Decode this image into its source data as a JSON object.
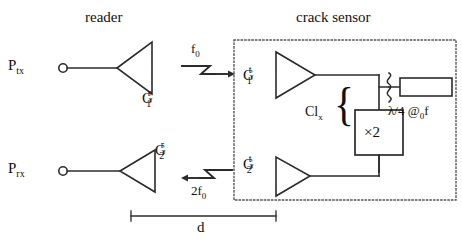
{
  "diagram": {
    "type": "schematic",
    "stroke_color": "#2b2b2b",
    "text_color": "#111111",
    "background": "#ffffff"
  },
  "reader": {
    "title": "reader",
    "tx_port_label_main": "P",
    "tx_port_label_sub": "tx",
    "rx_port_label_main": "P",
    "rx_port_label_sub": "rx",
    "amp_tx": {
      "base": "G",
      "sub": "1",
      "sup": "r"
    },
    "amp_rx": {
      "base": "G",
      "sub": "2",
      "sup": "r"
    }
  },
  "sensor": {
    "title": "crack sensor",
    "amp_in": {
      "base": "G",
      "sub": "1",
      "sup": "t"
    },
    "amp_out": {
      "base": "G",
      "sub": "2",
      "sup": "t"
    },
    "coupling_label_main": "Cl",
    "coupling_label_sub": "x",
    "brace_glyph": "{",
    "multiplier_label": "×2",
    "resonator_label_main": "λ/4 @",
    "resonator_label_sub": "0",
    "resonator_label_tail": "f"
  },
  "signals": {
    "uplink_main": "f",
    "uplink_sub": "0",
    "downlink_main": "2f",
    "downlink_sub": "0"
  },
  "dimension": {
    "label": "d"
  }
}
